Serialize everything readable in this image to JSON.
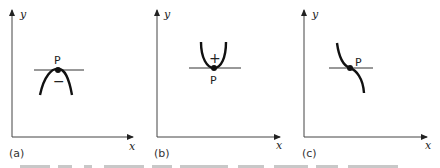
{
  "figure": {
    "panels": [
      {
        "id": "a",
        "label": "(a)",
        "x_axis_label": "x",
        "y_axis_label": "y",
        "point_label": "P",
        "curvature_sign": "−",
        "curve_type": "maximum"
      },
      {
        "id": "b",
        "label": "(b)",
        "x_axis_label": "x",
        "y_axis_label": "y",
        "point_label": "P",
        "curvature_sign": "+",
        "curve_type": "minimum"
      },
      {
        "id": "c",
        "label": "(c)",
        "x_axis_label": "x",
        "y_axis_label": "y",
        "point_label": "P",
        "curvature_sign": "",
        "curve_type": "point of inflection"
      }
    ],
    "colors": {
      "ink": "#1a1a1a",
      "background": "#ffffff"
    }
  }
}
